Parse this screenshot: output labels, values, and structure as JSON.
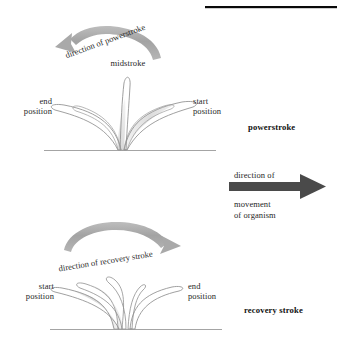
{
  "figure": {
    "type": "biology-diagram",
    "top_rule": {
      "name": "top-black-rule",
      "color": "#000000"
    },
    "background_color": "#ffffff"
  },
  "colors": {
    "ink": "#262626",
    "outline": "#8a8a8a",
    "arrow_light_gray": "#a9a9a9",
    "arrow_dark_gray": "#4a4a4a",
    "shade_fill": "#e2e2e2",
    "baseline": "#9a9a9a",
    "rule_black": "#000000"
  },
  "panels": {
    "powerstroke": {
      "title": "powerstroke",
      "arc_label": "direction of powerstroke",
      "arc_label_letters": [
        "d",
        "i",
        "r",
        "e",
        "c",
        "t",
        "i",
        "o",
        "n",
        " ",
        "o",
        "f",
        " ",
        "p",
        "o",
        "w",
        "e",
        "r",
        "s",
        "t",
        "r",
        "o",
        "k",
        "e"
      ],
      "arc_direction": "right-to-left",
      "midstroke_label": "midstroke",
      "left_label_line1": "end",
      "left_label_line2": "position",
      "right_label_line1": "start",
      "right_label_line2": "position"
    },
    "organism": {
      "label_line1": "direction of",
      "label_line2": "movement",
      "label_line3": "of organism",
      "arrow_direction": "right"
    },
    "recovery": {
      "title": "recovery stroke",
      "arc_label": "direction of recovery stroke",
      "arc_label_letters": [
        "d",
        "i",
        "r",
        "e",
        "c",
        "t",
        "i",
        "o",
        "n",
        " ",
        "o",
        "f",
        " ",
        "r",
        "e",
        "c",
        "o",
        "v",
        "e",
        "r",
        "y",
        " ",
        "s",
        "t",
        "r",
        "o",
        "k",
        "e"
      ],
      "arc_direction": "left-to-right",
      "left_label_line1": "start",
      "left_label_line2": "position",
      "right_label_line1": "end",
      "right_label_line2": "position"
    }
  }
}
